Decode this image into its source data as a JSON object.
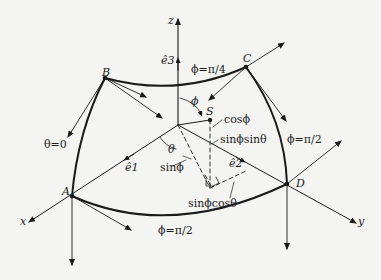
{
  "figure": {
    "type": "spherical-coordinates-octant-diagram",
    "axes": {
      "x": "x",
      "y": "y",
      "z": "z"
    },
    "unit_vectors": {
      "e1": "ê1",
      "e2": "ê2",
      "e3": "ê3"
    },
    "points": {
      "A": "A",
      "B": "B",
      "C": "C",
      "D": "D",
      "S": "S"
    },
    "boundary_labels": {
      "theta_zero": "θ=0",
      "phi_pi_over_4": "ϕ=π/4",
      "phi_pi_over_2_right": "ϕ=π/2",
      "phi_pi_over_2_bottom": "ϕ=π/2"
    },
    "angles": {
      "phi": "ϕ",
      "theta": "θ"
    },
    "components": {
      "cos_phi": "cosϕ",
      "sin_phi": "sinϕ",
      "sin_phi_sin_theta": "sinϕsinθ",
      "sin_phi_cos_theta": "sinϕcosθ"
    },
    "colors": {
      "ink": "#1a1a1a",
      "paper": "#f4f4f3"
    }
  }
}
